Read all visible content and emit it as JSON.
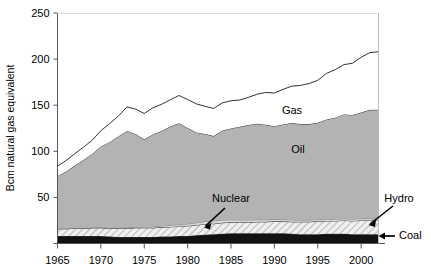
{
  "chart_data": {
    "type": "area",
    "stacked": true,
    "title": "",
    "xlabel": "",
    "ylabel": "Bcm natural gas equivalent",
    "xlim": [
      1965,
      2002
    ],
    "ylim": [
      0,
      250
    ],
    "xticks": [
      1965,
      1970,
      1975,
      1980,
      1985,
      1990,
      1995,
      2000
    ],
    "yticks": [
      0,
      50,
      100,
      150,
      200,
      250
    ],
    "ytick_labels": [
      "",
      "50",
      "100",
      "150",
      "200",
      "250"
    ],
    "grid": false,
    "legend": "inline-annotations",
    "x": [
      1965,
      1966,
      1967,
      1968,
      1969,
      1970,
      1971,
      1972,
      1973,
      1974,
      1975,
      1976,
      1977,
      1978,
      1979,
      1980,
      1981,
      1982,
      1983,
      1984,
      1985,
      1986,
      1987,
      1988,
      1989,
      1990,
      1991,
      1992,
      1993,
      1994,
      1995,
      1996,
      1997,
      1998,
      1999,
      2000,
      2001,
      2002
    ],
    "series": [
      {
        "name": "Coal",
        "color": "#111111",
        "pattern": "solid-black",
        "values": [
          8,
          8,
          8,
          8,
          8,
          8,
          7.5,
          7,
          7,
          7,
          7,
          7,
          7.5,
          7.5,
          8,
          8,
          9,
          9.5,
          10,
          10.5,
          11,
          11,
          11,
          11,
          11,
          11,
          11,
          10.5,
          10,
          10,
          10,
          10.5,
          10.5,
          10.5,
          10,
          10,
          10,
          10
        ]
      },
      {
        "name": "Hydro",
        "color": "#e6e6e6",
        "pattern": "diagonal-hatch",
        "values": [
          8,
          8,
          8.5,
          8.5,
          9,
          9,
          9,
          9.5,
          9.5,
          10,
          10,
          10,
          10,
          10.5,
          10.5,
          11,
          11,
          11.5,
          11.5,
          12,
          12,
          12,
          12,
          12.5,
          12.5,
          13,
          13,
          13,
          13.5,
          13.5,
          14,
          14,
          14,
          14.5,
          14.5,
          15,
          15,
          15
        ]
      },
      {
        "name": "Nuclear",
        "color": "#d8d8d8",
        "pattern": "thin-band",
        "values": [
          0,
          0,
          0,
          0,
          0,
          0.3,
          0.4,
          0.5,
          0.6,
          0.8,
          1,
          1.2,
          1.5,
          1.8,
          2,
          2.2,
          2.5,
          2.8,
          3,
          3,
          2.8,
          2.6,
          2.5,
          2.4,
          2.3,
          2.2,
          2.2,
          2.1,
          2,
          2,
          2,
          2,
          2,
          2,
          2,
          2,
          2,
          2
        ]
      },
      {
        "name": "Oil",
        "color": "#b3b3b3",
        "pattern": "solid-grey",
        "values": [
          57,
          62,
          68,
          74,
          80,
          88,
          93,
          99,
          105,
          101,
          95,
          100,
          103,
          107,
          110,
          104,
          98,
          95,
          92,
          97,
          99,
          101,
          103,
          104,
          103,
          101,
          103,
          105,
          104,
          104,
          105,
          108,
          110,
          113,
          113,
          115,
          118,
          118
        ]
      },
      {
        "name": "Gas",
        "color": "#ffffff",
        "pattern": "white",
        "values": [
          11,
          12,
          13,
          14,
          15,
          17,
          20,
          22,
          26,
          27,
          28,
          29,
          29,
          29,
          30,
          31,
          31,
          30,
          30,
          30,
          30,
          29,
          30,
          32,
          35,
          36,
          38,
          40,
          42,
          44,
          46,
          50,
          52,
          54,
          56,
          60,
          62,
          63
        ]
      }
    ],
    "annotations": [
      {
        "text": "Gas",
        "x": 292,
        "y": 114
      },
      {
        "text": "Oil",
        "x": 298,
        "y": 153
      },
      {
        "text": "Nuclear",
        "x": 231,
        "y": 202
      },
      {
        "text": "Hydro",
        "x": 399,
        "y": 202
      },
      {
        "text": "Coal",
        "x": 399,
        "y": 239
      }
    ]
  },
  "axis": {
    "y_title": "Bcm natural gas equivalent",
    "y_ticks": [
      "250",
      "200",
      "150",
      "100",
      "50"
    ],
    "x_ticks": [
      "1965",
      "1970",
      "1975",
      "1980",
      "1985",
      "1990",
      "1995",
      "2000"
    ]
  },
  "labels": {
    "gas": "Gas",
    "oil": "Oil",
    "nuclear": "Nuclear",
    "hydro": "Hydro",
    "coal": "Coal"
  },
  "colors": {
    "coal": "#111111",
    "hydro_hatch": "#e8e8e8",
    "oil": "#b3b3b3",
    "gas": "#ffffff",
    "axis": "#555555",
    "line": "#333333"
  }
}
